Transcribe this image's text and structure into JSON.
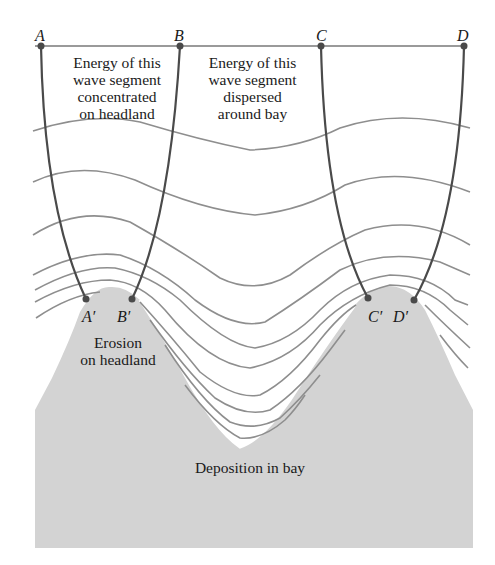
{
  "diagram": {
    "type": "wave-refraction",
    "colors": {
      "land": "#d3d3d3",
      "water": "#ffffff",
      "wave_line": "#8e8e8e",
      "ray_line": "#4a4a4a",
      "baseline": "#9a9a9a",
      "text": "#1a1a1a"
    },
    "points": {
      "A": "A",
      "B": "B",
      "C": "C",
      "D": "D",
      "A_prime": "A′",
      "B_prime": "B′",
      "C_prime": "C′",
      "D_prime": "D′"
    },
    "labels": {
      "headland_energy": "Energy of this\nwave segment\nconcentrated\non headland",
      "bay_energy": "Energy of this\nwave segment\ndispersed\naround bay",
      "erosion": "Erosion\non headland",
      "deposition": "Deposition in bay"
    }
  }
}
